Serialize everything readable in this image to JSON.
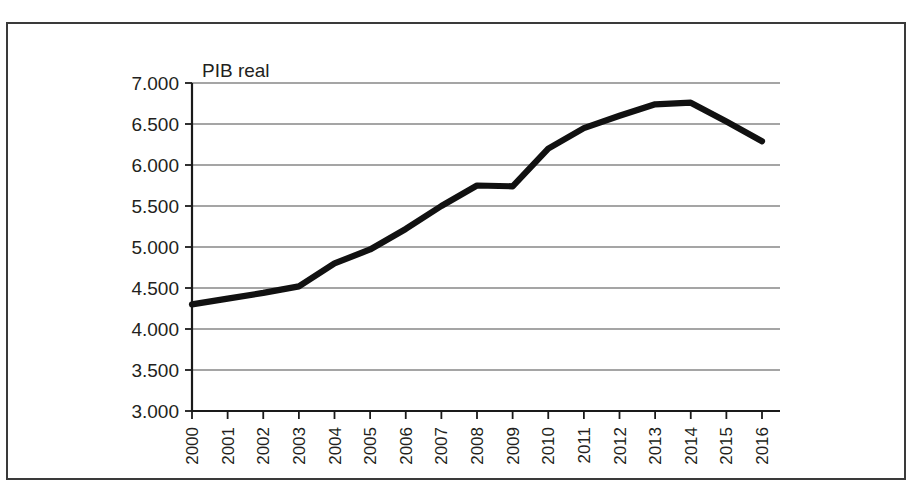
{
  "figure": {
    "caption_remnant": "",
    "frame_color": "#3a3a3a",
    "background_color": "#ffffff"
  },
  "chart_data": {
    "type": "line",
    "title": "",
    "subtitle": "",
    "xlabel": "",
    "ylabel": "",
    "series_label": "PIB real",
    "legend_position": "inline-top-left",
    "grid": true,
    "line_color": "#111111",
    "x": [
      2000,
      2001,
      2002,
      2003,
      2004,
      2005,
      2006,
      2007,
      2008,
      2009,
      2010,
      2011,
      2012,
      2013,
      2014,
      2015,
      2016
    ],
    "categories": [
      "2000",
      "2001",
      "2002",
      "2003",
      "2004",
      "2005",
      "2006",
      "2007",
      "2008",
      "2009",
      "2010",
      "2011",
      "2012",
      "2013",
      "2014",
      "2015",
      "2016"
    ],
    "values": [
      4300,
      4370,
      4440,
      4520,
      4800,
      4970,
      5220,
      5500,
      5750,
      5740,
      6200,
      6450,
      6600,
      6740,
      6760,
      6530,
      6290
    ],
    "ylim": [
      3000,
      7000
    ],
    "ytick_values": [
      3000,
      3500,
      4000,
      4500,
      5000,
      5500,
      6000,
      6500,
      7000
    ],
    "ytick_labels": [
      "3.000",
      "3.500",
      "4.000",
      "4.500",
      "5.000",
      "5.500",
      "6.000",
      "6.500",
      "7.000"
    ],
    "xtick_labels": [
      "2000",
      "2001",
      "2002",
      "2003",
      "2004",
      "2005",
      "2006",
      "2007",
      "2008",
      "2009",
      "2010",
      "2011",
      "2012",
      "2013",
      "2014",
      "2015",
      "2016"
    ],
    "xtick_rotation": -90,
    "series": [
      {
        "name": "PIB real",
        "values": [
          4300,
          4370,
          4440,
          4520,
          4800,
          4970,
          5220,
          5500,
          5750,
          5740,
          6200,
          6450,
          6600,
          6740,
          6760,
          6530,
          6290
        ]
      }
    ]
  }
}
